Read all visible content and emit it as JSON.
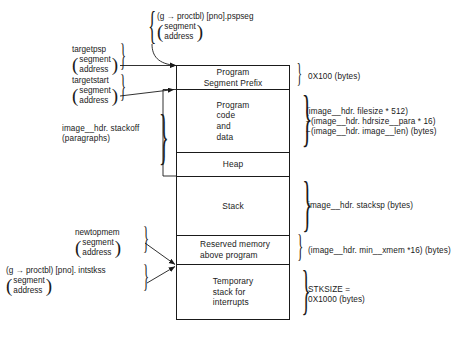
{
  "diagram": {
    "memory_map": {
      "blocks": [
        {
          "id": "psp",
          "label": "Program\nSegment Prefix"
        },
        {
          "id": "code",
          "label": "Program\ncode\nand\ndata"
        },
        {
          "id": "heap",
          "label": "Heap"
        },
        {
          "id": "stack",
          "label": "Stack"
        },
        {
          "id": "reserved",
          "label": "Reserved  memory\nabove  program"
        },
        {
          "id": "tempstack",
          "label": "Temporary\nstack for\ninterrupts"
        }
      ]
    },
    "left_labels": [
      {
        "id": "pspseg",
        "name": "(g → proctbl) [pno].pspseg",
        "qualifier_line1": "segment",
        "qualifier_line2": "address"
      },
      {
        "id": "targetpsp",
        "name": "targetpsp",
        "qualifier_line1": "segment",
        "qualifier_line2": "address"
      },
      {
        "id": "targetstart",
        "name": "targetstart",
        "qualifier_line1": "segment",
        "qualifier_line2": "address"
      },
      {
        "id": "stackoff",
        "name": "image__hdr. stackoff",
        "qualifier_line1": "(paragraphs)",
        "qualifier_line2": ""
      },
      {
        "id": "newtopmem",
        "name": "newtopmem",
        "qualifier_line1": "segment",
        "qualifier_line2": "address"
      },
      {
        "id": "intstkss",
        "name": "(g → proctbl) [pno]. intstkss",
        "qualifier_line1": "segment",
        "qualifier_line2": "address"
      }
    ],
    "right_labels": [
      {
        "id": "psp_size",
        "lines": [
          "0X100 (bytes)"
        ]
      },
      {
        "id": "code_size",
        "lines": [
          "(image__hdr. filesize * 512)",
          "−(image__hdr. hdrsize__para * 16)",
          "−(image__hdr. image__len) (bytes)"
        ]
      },
      {
        "id": "stack_size",
        "lines": [
          "image__hdr. stacksp (bytes)"
        ]
      },
      {
        "id": "reserved_size",
        "lines": [
          "(image__hdr. min__xmem *16) (bytes)"
        ]
      },
      {
        "id": "temp_size",
        "lines": [
          "STKSIZE =",
          "0X1000 (bytes)"
        ]
      }
    ]
  }
}
